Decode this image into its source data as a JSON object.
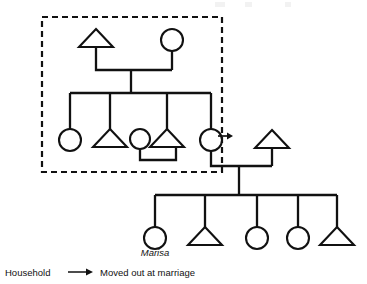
{
  "figure": {
    "type": "kinship-diagram",
    "ego_label": "Marisa",
    "legend": {
      "household_label": "Household",
      "arrow_icon": "right-arrow-icon",
      "moved_out_label": "Moved out at marriage"
    },
    "household_box": {
      "label": "Household",
      "style": "dashed",
      "x": 42,
      "y": 17,
      "width": 180,
      "height": 155
    },
    "symbols": {
      "male": "triangle",
      "female": "circle"
    },
    "generations": [
      {
        "id": "gen1",
        "name": "Founding couple",
        "members": [
          {
            "id": "g1-husband",
            "sex": "male",
            "symbol": "triangle",
            "cx": 96,
            "cy": 40,
            "in_household": true
          },
          {
            "id": "g1-wife",
            "sex": "female",
            "symbol": "circle",
            "cx": 172,
            "cy": 40,
            "in_household": true
          }
        ]
      },
      {
        "id": "gen2",
        "name": "Children of founding couple",
        "members": [
          {
            "id": "g2-daughter-1",
            "sex": "female",
            "symbol": "circle",
            "cx": 70,
            "cy": 140,
            "in_household": true
          },
          {
            "id": "g2-son-1",
            "sex": "male",
            "symbol": "triangle",
            "cx": 110,
            "cy": 140,
            "in_household": true
          },
          {
            "id": "g2-son-1-wife",
            "sex": "female",
            "symbol": "circle",
            "cx": 140,
            "cy": 140,
            "in_household": true,
            "married_in": true
          },
          {
            "id": "g2-son-2",
            "sex": "male",
            "symbol": "triangle",
            "cx": 167,
            "cy": 140,
            "in_household": true
          },
          {
            "id": "g2-daughter-2",
            "sex": "female",
            "symbol": "circle",
            "cx": 211,
            "cy": 140,
            "in_household": true,
            "moved_out_at_marriage": true
          },
          {
            "id": "g2-daughter-2-husband",
            "sex": "male",
            "symbol": "triangle",
            "cx": 272,
            "cy": 140,
            "in_household": false,
            "married_in": true
          }
        ]
      },
      {
        "id": "gen3",
        "name": "Children of the out-married daughter",
        "members": [
          {
            "id": "g3-child-1",
            "sex": "female",
            "symbol": "circle",
            "cx": 155,
            "cy": 238,
            "label": "Marisa",
            "is_ego": true
          },
          {
            "id": "g3-child-2",
            "sex": "male",
            "symbol": "triangle",
            "cx": 205,
            "cy": 238
          },
          {
            "id": "g3-child-3",
            "sex": "female",
            "symbol": "circle",
            "cx": 257,
            "cy": 238
          },
          {
            "id": "g3-child-4",
            "sex": "female",
            "symbol": "circle",
            "cx": 298,
            "cy": 238
          },
          {
            "id": "g3-child-5",
            "sex": "male",
            "symbol": "triangle",
            "cx": 337,
            "cy": 238
          }
        ]
      }
    ],
    "marriages": [
      {
        "id": "m-gen1",
        "partners": [
          "g1-husband",
          "g1-wife"
        ],
        "bar_y": 70
      },
      {
        "id": "m-gen2-son1",
        "partners": [
          "g2-son-1",
          "g2-son-1-wife"
        ],
        "bar_y": 160,
        "link_below": true
      },
      {
        "id": "m-gen2-daughter2",
        "partners": [
          "g2-daughter-2",
          "g2-daughter-2-husband"
        ],
        "bar_y": 166
      }
    ],
    "colors": {
      "line": "#111111",
      "symbol_fill": "#ffffff",
      "background": "#ffffff"
    }
  }
}
